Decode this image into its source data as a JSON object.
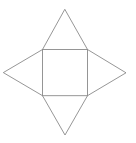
{
  "diagram": {
    "stroke_color": "#8a8a8a",
    "background": "#ffffff",
    "square": {
      "x1": 42.5,
      "y1": 49.5,
      "x2": 87.5,
      "y2": 95.7
    },
    "triangles": [
      {
        "name": "top",
        "apex": [
          64.8,
          9.3
        ]
      },
      {
        "name": "left",
        "apex": [
          3.3,
          72.6
        ]
      },
      {
        "name": "right",
        "apex": [
          126,
          72.8
        ]
      },
      {
        "name": "bottom",
        "apex": [
          65,
          135
        ]
      }
    ]
  }
}
